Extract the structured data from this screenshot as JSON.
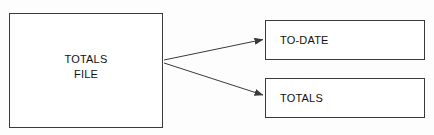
{
  "diagram": {
    "background_color": "#fdfdfd",
    "line_color": "#3a3a3a",
    "text_color": "#111111",
    "nodes": [
      {
        "id": "totals-file",
        "label_line1": "TOTALS",
        "label_line2": "FILE",
        "shape": "rectangle",
        "align": "center"
      },
      {
        "id": "to-date",
        "label": "TO-DATE",
        "shape": "rectangle",
        "align": "left"
      },
      {
        "id": "totals",
        "label": "TOTALS",
        "shape": "rectangle",
        "align": "left"
      }
    ],
    "connectors": [
      {
        "id": "totals-file-to-to-date",
        "from": "totals-file",
        "to": "to-date",
        "style": "arrow",
        "label": ""
      },
      {
        "id": "totals-file-to-totals",
        "from": "totals-file",
        "to": "totals",
        "style": "arrow",
        "label": ""
      }
    ]
  }
}
